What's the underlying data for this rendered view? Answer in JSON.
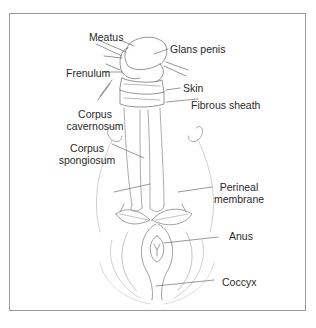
{
  "diagram": {
    "type": "anatomical illustration",
    "labels": [
      {
        "id": "meatus",
        "text": "Meatus"
      },
      {
        "id": "glans",
        "text": "Glans penis"
      },
      {
        "id": "frenulum",
        "text": "Frenulum"
      },
      {
        "id": "skin",
        "text": "Skin"
      },
      {
        "id": "fibrous",
        "text": "Fibrous sheath"
      },
      {
        "id": "cav1",
        "text": "Corpus"
      },
      {
        "id": "cav2",
        "text": "cavernosum"
      },
      {
        "id": "spo1",
        "text": "Corpus"
      },
      {
        "id": "spo2",
        "text": "spongiosum"
      },
      {
        "id": "per1",
        "text": "Perineal"
      },
      {
        "id": "per2",
        "text": "membrane"
      },
      {
        "id": "anus",
        "text": "Anus"
      },
      {
        "id": "coccyx",
        "text": "Coccyx"
      }
    ],
    "colors": {
      "line": "#555555",
      "light_line": "#b5b5b5",
      "text": "#2a2a2a",
      "frame": "#9a9a9a"
    }
  }
}
